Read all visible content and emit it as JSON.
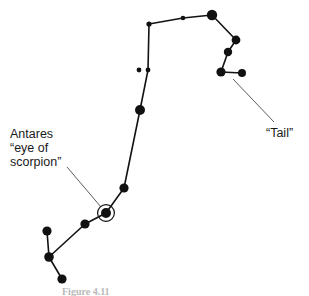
{
  "figure": {
    "background_color": "#ffffff",
    "star_color": "#111111",
    "line_color": "#121212",
    "leader_color": "#4a4a4a",
    "text_color": "#1a1a1a",
    "caption": "Figure 4.11"
  },
  "labels": {
    "antares": {
      "line1": "Antares",
      "line2": "“eye of",
      "line3": "scorpion”",
      "x": 10,
      "y": 138
    },
    "tail": {
      "text": "“Tail”",
      "x": 266,
      "y": 137
    }
  },
  "chart_data": {
    "type": "scatter",
    "xlabel": "",
    "ylabel": "",
    "xlim": [
      0,
      309
    ],
    "ylim": [
      0,
      296
    ],
    "grid": false,
    "legend": "none",
    "stars": [
      {
        "id": "s1",
        "name": "upper-left-small",
        "x": 149,
        "y": 24,
        "r": 2.6
      },
      {
        "id": "s2",
        "name": "upper-mid-small",
        "x": 183,
        "y": 18,
        "r": 2.3
      },
      {
        "id": "s3",
        "name": "upper-right-bright",
        "x": 212,
        "y": 15,
        "r": 5.2
      },
      {
        "id": "s4",
        "name": "tail-upper",
        "x": 236,
        "y": 40,
        "r": 4.4
      },
      {
        "id": "s5",
        "name": "tail-mid",
        "x": 228,
        "y": 52,
        "r": 4.2
      },
      {
        "id": "s6",
        "name": "tail-stinger-left",
        "x": 221,
        "y": 72,
        "r": 4.6
      },
      {
        "id": "s7",
        "name": "tail-stinger-right",
        "x": 242,
        "y": 73,
        "r": 4.0
      },
      {
        "id": "s8",
        "name": "body-double-left",
        "x": 139,
        "y": 70,
        "r": 2.4
      },
      {
        "id": "s9",
        "name": "body-double-right",
        "x": 148,
        "y": 70,
        "r": 2.4
      },
      {
        "id": "s10",
        "name": "body-mid-bright",
        "x": 140,
        "y": 110,
        "r": 5.0
      },
      {
        "id": "s11",
        "name": "body-lower",
        "x": 124,
        "y": 188,
        "r": 4.6
      },
      {
        "id": "s12",
        "name": "antares",
        "x": 106,
        "y": 213,
        "r": 5.0,
        "ring": 8.4,
        "highlight": true
      },
      {
        "id": "s13",
        "name": "claw-inner",
        "x": 85,
        "y": 224,
        "r": 4.6
      },
      {
        "id": "s14",
        "name": "claw-upper",
        "x": 47,
        "y": 231,
        "r": 4.6
      },
      {
        "id": "s15",
        "name": "claw-joint",
        "x": 49,
        "y": 257,
        "r": 4.8
      },
      {
        "id": "s16",
        "name": "claw-lower",
        "x": 62,
        "y": 279,
        "r": 4.6
      }
    ],
    "links": [
      {
        "from": "s1",
        "to": "s2",
        "width": 1.6
      },
      {
        "from": "s2",
        "to": "s3",
        "width": 1.6
      },
      {
        "from": "s3",
        "to": "s4",
        "width": 1.6
      },
      {
        "from": "s4",
        "to": "s5",
        "width": 1.6
      },
      {
        "from": "s5",
        "to": "s6",
        "width": 1.6
      },
      {
        "from": "s6",
        "to": "s7",
        "width": 1.6
      },
      {
        "from": "s1",
        "to": "s9",
        "width": 1.6
      },
      {
        "from": "s9",
        "to": "s10",
        "width": 1.6
      },
      {
        "from": "s10",
        "to": "s11",
        "width": 1.6
      },
      {
        "from": "s11",
        "to": "s12",
        "width": 1.6
      },
      {
        "from": "s12",
        "to": "s13",
        "width": 1.6
      },
      {
        "from": "s13",
        "to": "s15",
        "width": 1.6
      },
      {
        "from": "s15",
        "to": "s14",
        "width": 1.6
      },
      {
        "from": "s15",
        "to": "s16",
        "width": 1.6
      }
    ],
    "leaders": [
      {
        "name": "antares-leader",
        "x1": 67,
        "y1": 167,
        "x2": 101,
        "y2": 207
      },
      {
        "name": "tail-leader",
        "x1": 233,
        "y1": 79,
        "x2": 274,
        "y2": 122
      }
    ],
    "annotations": [
      {
        "name": "antares-annotation",
        "text": "Antares “eye of scorpion”",
        "target": "s12"
      },
      {
        "name": "tail-annotation",
        "text": "“Tail”",
        "target": "s7"
      }
    ]
  }
}
